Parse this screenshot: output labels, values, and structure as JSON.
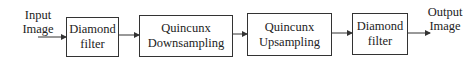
{
  "diagram": {
    "input_label": [
      "Input",
      "Image"
    ],
    "output_label": [
      "Output",
      "Image"
    ],
    "blocks": [
      {
        "id": "diamond-filter-1",
        "lines": [
          "Diamond",
          "filter"
        ]
      },
      {
        "id": "quincunx-downsampling",
        "lines": [
          "Quincunx",
          "Downsampling"
        ]
      },
      {
        "id": "quincunx-upsampling",
        "lines": [
          "Quincunx",
          "Upsampling"
        ]
      },
      {
        "id": "diamond-filter-2",
        "lines": [
          "Diamond",
          "filter"
        ]
      }
    ],
    "colors": {
      "stroke": "#333333",
      "background": "#ffffff"
    }
  }
}
